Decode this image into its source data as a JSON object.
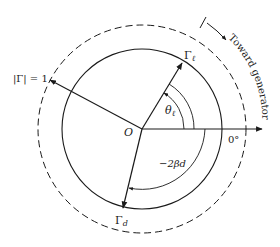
{
  "diagram": {
    "type": "reflection-coefficient-phasor-diagram",
    "center_label": "O",
    "unit_circle_label": "|Γ| = 1",
    "load_reflection_label": "Γ",
    "load_reflection_subscript": "ℓ",
    "input_reflection_label": "Γ",
    "input_reflection_subscript": "d",
    "load_angle_label": "θ",
    "load_angle_subscript": "ℓ",
    "phase_shift_label": "−2βd",
    "reference_angle_label": "0°",
    "direction_label": "Toward generator",
    "colors": {
      "stroke": "#1a1a1a",
      "background": "#ffffff"
    }
  }
}
